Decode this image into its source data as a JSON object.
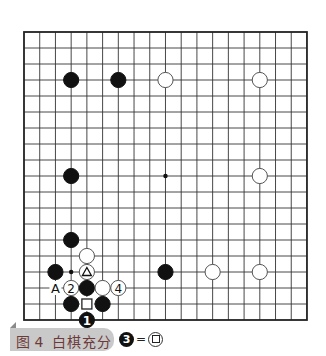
{
  "board": {
    "cols": 19,
    "rows": 19,
    "origin_x": 24,
    "origin_y": 32,
    "spacing_x": 15.72,
    "spacing_y": 16,
    "line_color": "#333333",
    "star_points": [
      [
        9,
        9
      ],
      [
        3,
        15
      ]
    ],
    "stones": [
      {
        "color": "black",
        "col": 3,
        "row": 3
      },
      {
        "color": "black",
        "col": 6,
        "row": 3
      },
      {
        "color": "white",
        "col": 9,
        "row": 3
      },
      {
        "color": "white",
        "col": 15,
        "row": 3
      },
      {
        "color": "black",
        "col": 3,
        "row": 9
      },
      {
        "color": "white",
        "col": 15,
        "row": 9
      },
      {
        "color": "black",
        "col": 3,
        "row": 13
      },
      {
        "color": "white",
        "col": 4,
        "row": 14
      },
      {
        "color": "black",
        "col": 2,
        "row": 15
      },
      {
        "color": "white",
        "col": 4,
        "row": 15,
        "mark": "triangle"
      },
      {
        "color": "black",
        "col": 9,
        "row": 15
      },
      {
        "color": "white",
        "col": 12,
        "row": 15
      },
      {
        "color": "white",
        "col": 15,
        "row": 15
      },
      {
        "color": "white",
        "col": 3,
        "row": 16,
        "label": "2"
      },
      {
        "color": "black",
        "col": 4,
        "row": 16
      },
      {
        "color": "white",
        "col": 5,
        "row": 16
      },
      {
        "color": "white",
        "col": 6,
        "row": 16,
        "label": "4"
      },
      {
        "color": "black",
        "col": 3,
        "row": 17
      },
      {
        "color": "black",
        "col": 5,
        "row": 17
      },
      {
        "color": "black",
        "col": 4,
        "row": 18,
        "label": "1"
      }
    ],
    "point_labels": [
      {
        "col": 2,
        "row": 16,
        "text": "A"
      }
    ],
    "empty_marks": [
      {
        "col": 4,
        "row": 17,
        "mark": "square"
      }
    ]
  },
  "caption": {
    "figure": "图 4",
    "title": "白棋充分"
  },
  "legend": {
    "stone_label": "3",
    "equals": "=",
    "mark": "square"
  }
}
